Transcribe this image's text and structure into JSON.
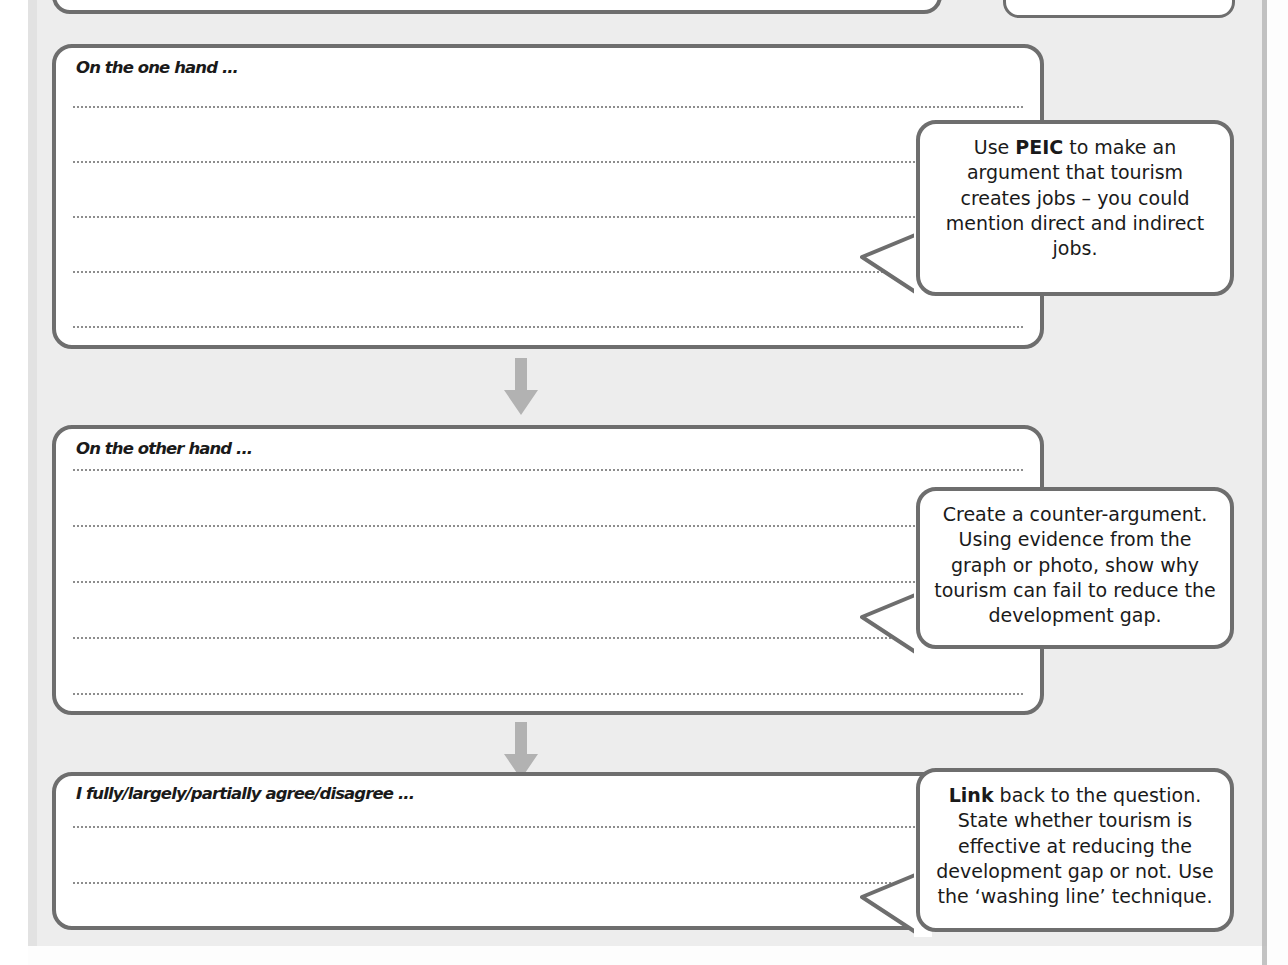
{
  "worksheet": {
    "type": "essay-planning-scaffold",
    "topic": "Tourism and the development gap",
    "colors": {
      "page_background": "#ededed",
      "box_border": "#6e6e6e",
      "box_fill": "#ffffff",
      "arrow": "#b0b0b0",
      "dotted_line": "#8d8d8d",
      "text": "#1a1a1a"
    }
  },
  "sections": [
    {
      "id": "one-hand",
      "heading": "On the one hand ...",
      "writing_lines": 5,
      "hint": {
        "id": "hint-peic",
        "lead_bold": "Use",
        "keyword": "PEIC",
        "text_before": "Use ",
        "text_after": " to make an argument that tourism creates jobs – you could mention direct and indirect jobs.",
        "full_text": "Use PEIC to make an argument that tourism creates jobs – you could mention direct and indirect jobs."
      }
    },
    {
      "id": "other-hand",
      "heading": "On the other hand ...",
      "writing_lines": 5,
      "hint": {
        "id": "hint-counter-argument",
        "keyword": "",
        "full_text": "Create a counter-argument. Using evidence from the graph or photo, show why tourism can fail to reduce the development gap."
      }
    },
    {
      "id": "conclusion",
      "heading": "I fully/largely/partially agree/disagree ...",
      "writing_lines": 2,
      "hint": {
        "id": "hint-link",
        "keyword": "Link",
        "text_after": " back to the question. State whether tourism is effective at reducing the development gap or not. Use the ‘washing line’ technique.",
        "full_text": "Link back to the question. State whether tourism is effective at reducing the development gap or not. Use the ‘washing line’ technique."
      }
    }
  ],
  "connectors": [
    {
      "id": "arrow-one-to-other",
      "icon": "down-arrow-icon",
      "direction": "down"
    },
    {
      "id": "arrow-other-to-conclusion",
      "icon": "down-arrow-icon",
      "direction": "down"
    }
  ],
  "partial_elements": {
    "top_box_left": "",
    "top_box_right": ""
  }
}
